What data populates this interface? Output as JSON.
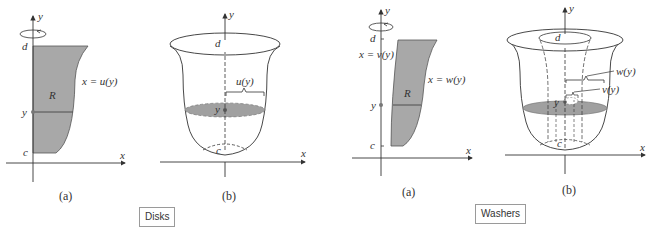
{
  "figure": {
    "colors": {
      "region_fill": "#a8a8a8",
      "disk_fill": "#a0a0a0",
      "line": "#333333",
      "tag_border": "#9a9a9a"
    },
    "disks": {
      "label": "Disks",
      "panel_a": {
        "caption": "(a)",
        "axis_y": "y",
        "axis_x": "x",
        "upper_bound": "d",
        "lower_bound": "c",
        "sample": "y",
        "region": "R",
        "curve": "x = u(y)",
        "rotation_icon": "rotation-arrow"
      },
      "panel_b": {
        "caption": "(b)",
        "axis_y": "y",
        "axis_x": "x",
        "upper_bound": "d",
        "lower_bound": "c",
        "sample": "y",
        "radius": "u(y)"
      }
    },
    "washers": {
      "label": "Washers",
      "panel_a": {
        "caption": "(a)",
        "axis_y": "y",
        "axis_x": "x",
        "upper_bound": "d",
        "lower_bound": "c",
        "sample": "y",
        "region": "R",
        "inner_curve": "x = v(y)",
        "outer_curve": "x = w(y)",
        "rotation_icon": "rotation-arrow"
      },
      "panel_b": {
        "caption": "(b)",
        "axis_y": "y",
        "axis_x": "x",
        "upper_bound": "d",
        "lower_bound": "c",
        "sample": "y",
        "outer_radius": "w(y)",
        "inner_radius": "v(y)"
      }
    }
  }
}
